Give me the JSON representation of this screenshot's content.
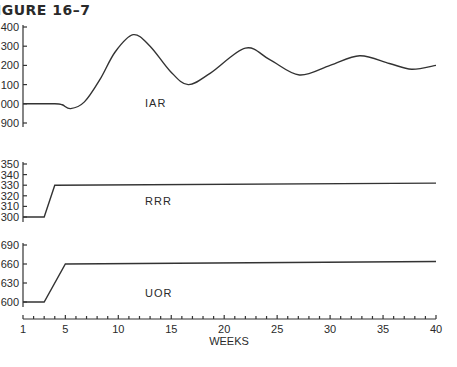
{
  "figure": {
    "title": "IGURE 16–7"
  },
  "chart_data": [
    {
      "type": "line",
      "title": "IAR",
      "series_label": "IAR",
      "xlabel": "WEEKS",
      "ylabel": "",
      "y_ticks": [
        "400",
        "300",
        "200",
        "100",
        "000",
        "900"
      ],
      "y_tick_values": [
        1400,
        1300,
        1200,
        1100,
        1000,
        900
      ],
      "ylim": [
        900,
        1400
      ],
      "x": [
        1,
        4,
        4.7,
        5.5,
        6.8,
        8.3,
        9.7,
        11.4,
        13,
        14.9,
        16.6,
        18.7,
        22,
        24.3,
        27.1,
        30,
        32.8,
        35.6,
        37.7,
        40
      ],
      "values": [
        1000,
        1000,
        995,
        975,
        1010,
        1130,
        1270,
        1360,
        1300,
        1170,
        1100,
        1160,
        1290,
        1230,
        1150,
        1200,
        1250,
        1210,
        1180,
        1200
      ]
    },
    {
      "type": "line",
      "title": "RRR",
      "series_label": "RRR",
      "xlabel": "WEEKS",
      "ylabel": "",
      "y_ticks": [
        "350",
        "340",
        "330",
        "320",
        "310",
        "300"
      ],
      "y_tick_values": [
        350,
        340,
        330,
        320,
        310,
        300
      ],
      "ylim": [
        300,
        350
      ],
      "x": [
        1,
        3,
        4,
        40
      ],
      "values": [
        300,
        300,
        330,
        332
      ]
    },
    {
      "type": "line",
      "title": "UOR",
      "series_label": "UOR",
      "xlabel": "WEEKS",
      "ylabel": "",
      "y_ticks": [
        "690",
        "660",
        "630",
        "600"
      ],
      "y_tick_values": [
        690,
        660,
        630,
        600
      ],
      "ylim": [
        600,
        690
      ],
      "x": [
        1,
        3,
        5,
        40
      ],
      "values": [
        600,
        600,
        660,
        664
      ]
    }
  ],
  "x_axis": {
    "label": "WEEKS",
    "ticks": [
      "1",
      "5",
      "10",
      "15",
      "20",
      "25",
      "30",
      "35",
      "40"
    ],
    "tick_values": [
      1,
      5,
      10,
      15,
      20,
      25,
      30,
      35,
      40
    ],
    "range": [
      1,
      40
    ]
  }
}
